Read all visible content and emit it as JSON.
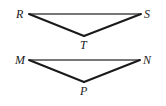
{
  "figure": {
    "type": "geometry-diagram",
    "background_color": "#ffffff",
    "stroke_color": "#1a1a1a",
    "top_edge_color": "#4a4a4a",
    "label_color": "#1a1a1a",
    "triangles": [
      {
        "name": "triangle-rst",
        "vertices": [
          {
            "label": "R",
            "x": 29,
            "y": 14,
            "label_x": 16,
            "label_y": 8
          },
          {
            "label": "S",
            "x": 141,
            "y": 14,
            "label_x": 144,
            "label_y": 8
          },
          {
            "label": "T",
            "x": 84,
            "y": 36,
            "label_x": 80,
            "label_y": 39
          }
        ],
        "edges": [
          {
            "name": "edge-RS",
            "from": "R",
            "to": "S",
            "width": 1.4,
            "color": "#4a4a4a"
          },
          {
            "name": "edge-RT",
            "from": "R",
            "to": "T",
            "width": 2.0,
            "color": "#1a1a1a"
          },
          {
            "name": "edge-TS",
            "from": "T",
            "to": "S",
            "width": 2.0,
            "color": "#1a1a1a"
          }
        ]
      },
      {
        "name": "triangle-mnp",
        "vertices": [
          {
            "label": "M",
            "x": 29,
            "y": 60,
            "label_x": 15,
            "label_y": 54
          },
          {
            "label": "N",
            "x": 140,
            "y": 60,
            "label_x": 143,
            "label_y": 54
          },
          {
            "label": "P",
            "x": 84,
            "y": 82,
            "label_x": 80,
            "label_y": 85
          }
        ],
        "edges": [
          {
            "name": "edge-MN",
            "from": "M",
            "to": "N",
            "width": 1.4,
            "color": "#4a4a4a"
          },
          {
            "name": "edge-MP",
            "from": "M",
            "to": "P",
            "width": 2.0,
            "color": "#1a1a1a"
          },
          {
            "name": "edge-PN",
            "from": "P",
            "to": "N",
            "width": 2.0,
            "color": "#1a1a1a"
          }
        ]
      }
    ]
  }
}
